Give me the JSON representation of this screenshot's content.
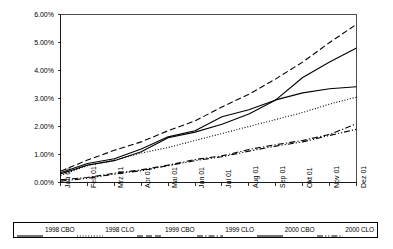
{
  "chart_data": {
    "type": "line",
    "title": "",
    "subtitle": "",
    "xlabel": "",
    "ylabel": "",
    "grid": false,
    "legend_position": "bottom",
    "categories": [
      "Jan 01",
      "Feb 01",
      "Mrz 01",
      "Apr 01",
      "Mai 01",
      "Jun 01",
      "Jul 01",
      "Aug 01",
      "Sep 01",
      "Okt 01",
      "Nov 01",
      "Dez 01"
    ],
    "ylim": [
      0,
      6
    ],
    "yticks": [
      0,
      1,
      2,
      3,
      4,
      5,
      6
    ],
    "ytick_labels": [
      "0.00%",
      "1.00%",
      "2.00%",
      "3.00%",
      "4.00%",
      "5.00%",
      "6.00%"
    ],
    "y_unit": "%",
    "series": [
      {
        "name": "1998 CBO",
        "style": "solid",
        "color": "#000000",
        "values": [
          0.35,
          0.68,
          0.85,
          1.2,
          1.63,
          1.85,
          2.35,
          2.6,
          2.95,
          3.2,
          3.35,
          3.42
        ]
      },
      {
        "name": "1998 CLO",
        "style": "dotted",
        "color": "#000000",
        "values": [
          0.25,
          0.6,
          0.8,
          1.05,
          1.25,
          1.5,
          1.75,
          2.0,
          2.25,
          2.5,
          2.8,
          3.05
        ]
      },
      {
        "name": "1999 CBO",
        "style": "dashed",
        "color": "#000000",
        "values": [
          0.4,
          0.8,
          1.15,
          1.45,
          1.85,
          2.2,
          2.7,
          3.15,
          3.7,
          4.3,
          5.0,
          5.65
        ]
      },
      {
        "name": "1999 CLO",
        "style": "dash-dot",
        "color": "#000000",
        "values": [
          0.1,
          0.18,
          0.33,
          0.45,
          0.62,
          0.82,
          0.95,
          1.18,
          1.35,
          1.5,
          1.72,
          2.1
        ]
      },
      {
        "name": "2000 CBO",
        "style": "solid",
        "color": "#000000",
        "values": [
          0.3,
          0.62,
          0.78,
          1.1,
          1.6,
          1.8,
          2.08,
          2.45,
          2.95,
          3.75,
          4.3,
          4.8
        ]
      },
      {
        "name": "2000 CLO",
        "style": "dash-dot-dot",
        "color": "#000000",
        "values": [
          0.05,
          0.15,
          0.3,
          0.42,
          0.6,
          0.78,
          0.92,
          1.12,
          1.3,
          1.45,
          1.68,
          1.9
        ]
      }
    ]
  },
  "legend": {
    "entries": [
      {
        "label": "1998 CBO"
      },
      {
        "label": "1998 CLO"
      },
      {
        "label": "1999 CBO"
      },
      {
        "label": "1999 CLO"
      },
      {
        "label": "2000 CBO"
      },
      {
        "label": "2000 CLO"
      }
    ]
  }
}
